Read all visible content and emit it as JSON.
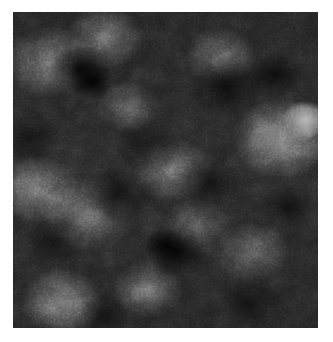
{
  "page": {
    "kind": "image-plate",
    "background_color": "#ffffff",
    "canvas_width": 333,
    "canvas_height": 342
  },
  "plate": {
    "label": "grayscale fractal noise texture",
    "x": 13,
    "y": 12,
    "width": 305,
    "height": 316,
    "colorspace": "grayscale",
    "base_color": "#2a2a2a",
    "darkest_color": "#000000",
    "brightest_color": "#ffffff",
    "mean_level_percent": 28,
    "texture_type": "fractal-noise",
    "octaves": 5,
    "base_frequency": 0.09,
    "has_border": false,
    "has_axes": false,
    "has_labels": false,
    "features": [
      {
        "name": "dark-blob-upper-left",
        "x_percent": 24,
        "y_percent": 20,
        "tone": "very-dark"
      },
      {
        "name": "dark-blob-upper-right",
        "x_percent": 78,
        "y_percent": 22,
        "tone": "dark"
      },
      {
        "name": "bright-highlight-right-edge",
        "x_percent": 96,
        "y_percent": 34,
        "tone": "very-bright"
      },
      {
        "name": "dark-blob-lower-center",
        "x_percent": 52,
        "y_percent": 75,
        "tone": "very-dark"
      },
      {
        "name": "bright-band-lower-left",
        "x_percent": 16,
        "y_percent": 92,
        "tone": "bright"
      },
      {
        "name": "bright-patch-left-mid",
        "x_percent": 8,
        "y_percent": 56,
        "tone": "bright"
      }
    ]
  },
  "chart_data": {
    "type": "heatmap",
    "title": "",
    "xlabel": "",
    "ylabel": "",
    "colormap": "gray",
    "vmin": 0,
    "vmax": 255,
    "grid": false,
    "legend": "none",
    "histogram_bins": [
      0,
      32,
      64,
      96,
      128,
      160,
      192,
      224,
      255
    ],
    "histogram_counts": [
      4,
      18,
      27,
      22,
      14,
      8,
      4,
      2,
      1
    ]
  }
}
